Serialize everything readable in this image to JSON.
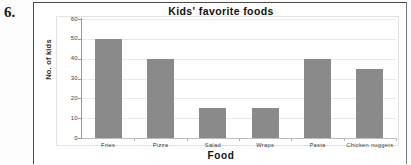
{
  "question": {
    "number": "6."
  },
  "chart_data": {
    "type": "bar",
    "title": "Kids' favorite foods",
    "xlabel": "Food",
    "ylabel": "No. of kids",
    "categories": [
      "Fries",
      "Pizza",
      "Salad",
      "Wraps",
      "Pasta",
      "Chicken nuggets"
    ],
    "values": [
      50,
      40,
      15,
      15,
      40,
      35
    ],
    "ylim": [
      0,
      60
    ],
    "ytick_step": 10,
    "yticks": [
      0,
      10,
      20,
      30,
      40,
      50,
      60
    ],
    "ytick_labels": [
      "0",
      "10",
      "20",
      "30",
      "40",
      "50",
      "60"
    ],
    "grid": true,
    "legend": false,
    "bar_color": "#8a8a8a",
    "gridline_color": "#eaeaea",
    "axis_color": "#9a9a9a",
    "text_color": "#111111"
  }
}
